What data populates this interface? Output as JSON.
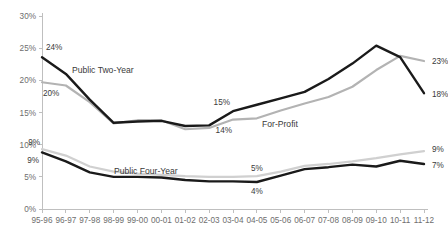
{
  "chart_data": {
    "type": "line",
    "title": "",
    "xlabel": "",
    "ylabel": "",
    "ylim": [
      0,
      30
    ],
    "ytick_labels": [
      "0%",
      "5%",
      "10%",
      "15%",
      "20%",
      "25%",
      "30%"
    ],
    "ytick_values": [
      0,
      5,
      10,
      15,
      20,
      25,
      30
    ],
    "grid": false,
    "legend_position": "inline-annotations",
    "categories": [
      "95-96",
      "96-97",
      "97-98",
      "98-99",
      "99-00",
      "00-01",
      "01-02",
      "02-03",
      "03-04",
      "04-05",
      "05-06",
      "06-07",
      "07-08",
      "08-09",
      "09-10",
      "10-11",
      "11-12"
    ],
    "series": [
      {
        "name": "Public Two-Year",
        "color": "#1a1a1a",
        "values": [
          23.6,
          21.0,
          17.0,
          13.4,
          13.6,
          13.7,
          12.9,
          13.0,
          15.2,
          16.2,
          17.2,
          18.2,
          20.2,
          22.6,
          25.4,
          23.6,
          18.0
        ]
      },
      {
        "name": "For-Profit",
        "color": "#b3b3b3",
        "values": [
          19.7,
          19.2,
          16.6,
          13.3,
          13.8,
          13.8,
          12.4,
          12.6,
          13.9,
          14.1,
          15.3,
          16.4,
          17.4,
          19.0,
          21.6,
          23.8,
          23.0
        ]
      },
      {
        "name": "Public Four-Year-Gray",
        "color": "#d0d0d0",
        "values": [
          9.3,
          8.3,
          6.6,
          5.8,
          5.5,
          5.3,
          5.1,
          5.0,
          5.0,
          5.1,
          5.8,
          6.7,
          7.0,
          7.4,
          7.9,
          8.5,
          9.0
        ]
      },
      {
        "name": "Public Four-Year",
        "color": "#1a1a1a",
        "values": [
          8.8,
          7.4,
          5.7,
          5.0,
          5.0,
          4.9,
          4.5,
          4.3,
          4.3,
          4.2,
          5.2,
          6.2,
          6.5,
          6.9,
          6.6,
          7.5,
          7.0
        ]
      }
    ],
    "annotations": [
      {
        "text": "24%",
        "series": "Public Two-Year",
        "x": 0,
        "y": 23.6
      },
      {
        "text": "20%",
        "series": "For-Profit",
        "x": 0,
        "y": 19.7
      },
      {
        "text": "15%",
        "series": "Public Two-Year",
        "x": 8,
        "y": 15.2
      },
      {
        "text": "14%",
        "series": "For-Profit",
        "x": 8,
        "y": 13.9
      },
      {
        "text": "23%",
        "series": "For-Profit",
        "x": 16,
        "y": 23.0
      },
      {
        "text": "18%",
        "series": "Public Two-Year",
        "x": 16,
        "y": 18.0
      },
      {
        "text": "9%",
        "series": "Public Four-Year-Gray",
        "x": 0,
        "y": 9.3
      },
      {
        "text": "9%",
        "series": "Public Four-Year",
        "x": 0,
        "y": 8.8
      },
      {
        "text": "5%",
        "series": "Public Four-Year-Gray",
        "x": 9,
        "y": 5.1
      },
      {
        "text": "4%",
        "series": "Public Four-Year",
        "x": 9,
        "y": 4.2
      },
      {
        "text": "9%",
        "series": "Public Four-Year-Gray",
        "x": 16,
        "y": 9.0
      },
      {
        "text": "7%",
        "series": "Public Four-Year",
        "x": 16,
        "y": 7.0
      }
    ],
    "series_labels": [
      {
        "text": "Public Two-Year"
      },
      {
        "text": "For-Profit"
      },
      {
        "text": "Public Four-Year"
      }
    ],
    "colors": {
      "dark_line": "#1a1a1a",
      "mid_gray_line": "#b3b3b3",
      "light_gray_line": "#d0d0d0",
      "axis": "#bfbfbf",
      "tick_text": "#6e6e6e",
      "label_text": "#3a3a3a",
      "background": "#ffffff"
    }
  }
}
